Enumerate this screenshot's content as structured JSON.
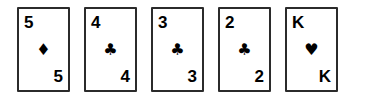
{
  "hand": {
    "name": "playing-card-hand",
    "card_count": 5,
    "cards": [
      {
        "rank": "5",
        "suit_name": "diamonds",
        "suit_symbol": "♦",
        "color": "#000000",
        "rank_top": "5",
        "rank_bottom": "5"
      },
      {
        "rank": "4",
        "suit_name": "clubs",
        "suit_symbol": "♣",
        "color": "#000000",
        "rank_top": "4",
        "rank_bottom": "4"
      },
      {
        "rank": "3",
        "suit_name": "clubs",
        "suit_symbol": "♣",
        "color": "#000000",
        "rank_top": "3",
        "rank_bottom": "3"
      },
      {
        "rank": "2",
        "suit_name": "clubs",
        "suit_symbol": "♣",
        "color": "#000000",
        "rank_top": "2",
        "rank_bottom": "2"
      },
      {
        "rank": "K",
        "suit_name": "hearts",
        "suit_symbol": "♥",
        "color": "#000000",
        "rank_top": "K",
        "rank_bottom": "K"
      }
    ]
  },
  "style": {
    "background": "#ffffff",
    "card_face": "#ffffff",
    "card_border": "#2b2b2b",
    "ink": "#000000"
  }
}
